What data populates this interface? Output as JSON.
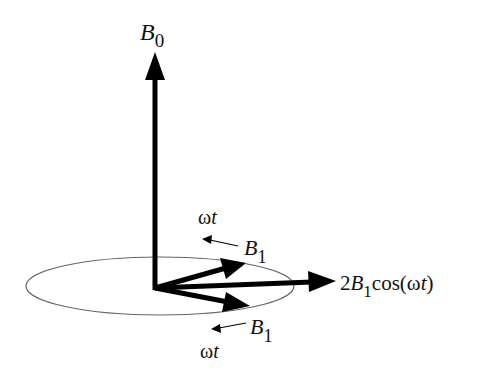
{
  "diagram": {
    "type": "vector-diagram",
    "labels": {
      "b0": {
        "main": "B",
        "sub": "0"
      },
      "omega_t_top": {
        "omega": "ω",
        "t": "t"
      },
      "b1_top": {
        "main": "B",
        "sub": "1"
      },
      "b1_bottom": {
        "main": "B",
        "sub": "1"
      },
      "omega_t_bottom": {
        "omega": "ω",
        "t": "t"
      },
      "resultant": {
        "prefix": "2",
        "main": "B",
        "sub": "1",
        "func": "cos(",
        "omega": "ω",
        "t": "t",
        "close": ")"
      }
    },
    "colors": {
      "vector": "#000000",
      "ellipse": "#666666",
      "text": "#111111",
      "background": "#ffffff"
    }
  }
}
